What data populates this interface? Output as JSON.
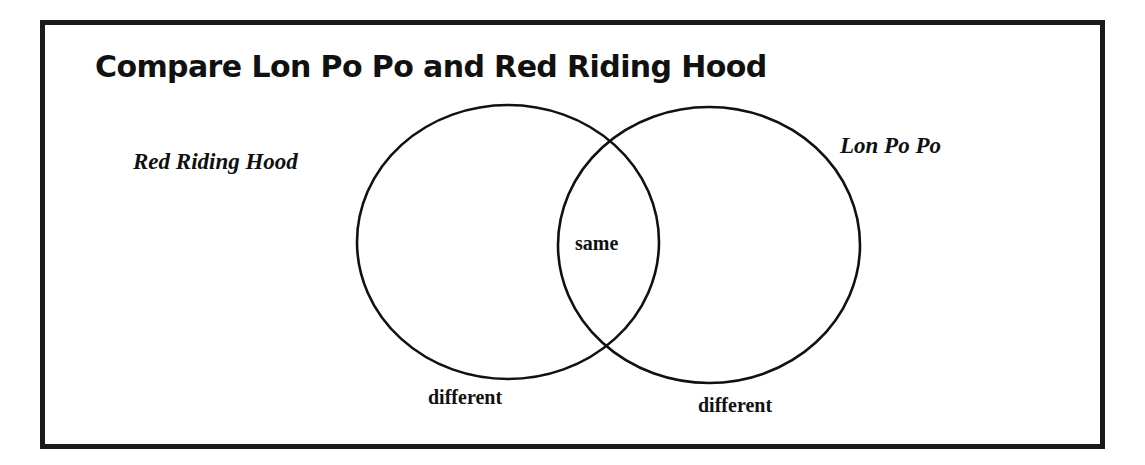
{
  "diagram": {
    "type": "venn",
    "title": "Compare Lon Po Po and Red Riding Hood",
    "sets": [
      {
        "name": "Red Riding Hood",
        "region_label": "different"
      },
      {
        "name": "Lon Po Po",
        "region_label": "different"
      }
    ],
    "intersection_label": "same",
    "colors": {
      "stroke": "#111111",
      "frame": "#1a1a1a",
      "background": "#ffffff"
    }
  }
}
